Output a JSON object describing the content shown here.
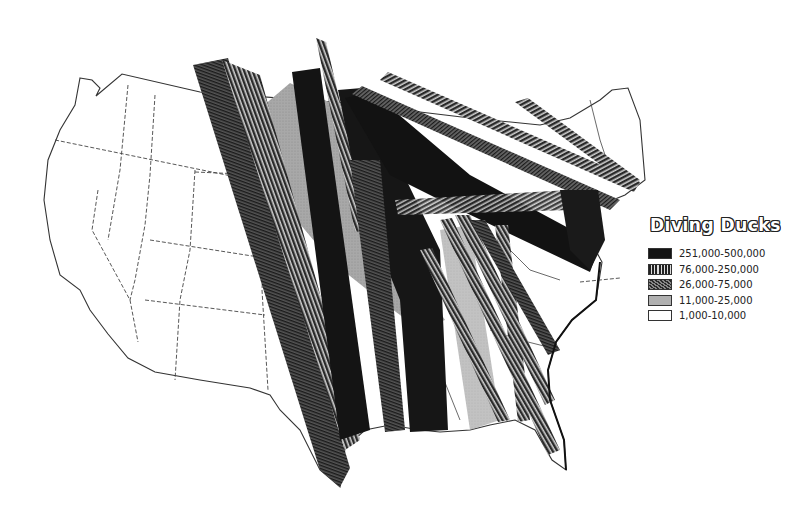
{
  "map": {
    "title": "Diving Ducks",
    "subject": "Diving duck migration corridors across the United States",
    "colors": {
      "background": "#ffffff",
      "outline": "#333333",
      "band_black": "#141414",
      "band_lined": "#3a3a3a",
      "band_hatched": "#4d4d4d",
      "band_stipple": "#a6a6a6"
    }
  },
  "legend": {
    "title": "Diving Ducks",
    "items": [
      {
        "label": "251,000-500,000",
        "pattern": "solid-black"
      },
      {
        "label": "76,000-250,000",
        "pattern": "vertical-lines"
      },
      {
        "label": "26,000-75,000",
        "pattern": "diagonal-hatch"
      },
      {
        "label": "11,000-25,000",
        "pattern": "stipple-gray"
      },
      {
        "label": "1,000-10,000",
        "pattern": "white"
      }
    ]
  }
}
